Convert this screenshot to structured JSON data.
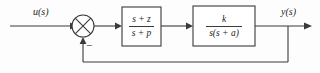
{
  "diagram": {
    "type": "control-system-block-diagram",
    "background_color": "#fdfdfd",
    "line_color": "#3a3a3a",
    "signals": {
      "input_label": "u(s)",
      "output_label": "y(s)",
      "feedback_sign": "−"
    },
    "summing_junction": {
      "name": "summing-junction",
      "shape": "circle-with-cross",
      "cx": 83,
      "cy": 26,
      "r": 11,
      "input_sign_positive": "+",
      "feedback_sign_negative": "−"
    },
    "blocks": [
      {
        "name": "compensator-block",
        "numerator": "s + z",
        "denominator": "s + p",
        "x": 122,
        "y": 7,
        "width": 39,
        "height": 39
      },
      {
        "name": "plant-block",
        "numerator": "k",
        "denominator": "s(s + a)",
        "x": 193,
        "y": 6,
        "width": 62,
        "height": 40
      }
    ],
    "feedback_path": {
      "name": "feedback-path",
      "takeoff_x": 288,
      "bottom_y": 62,
      "return_x": 83,
      "description": "unity negative feedback"
    }
  }
}
